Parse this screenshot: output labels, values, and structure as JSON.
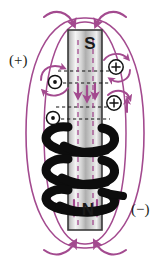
{
  "figure": {
    "type": "physics-diagram",
    "width": 165,
    "height": 266,
    "background_color": "#ffffff"
  },
  "labels": {
    "positive_terminal": "(+)",
    "negative_terminal": "(−)",
    "south_pole": "S",
    "north_pole": "N"
  },
  "colors": {
    "field_line": "#a34a8f",
    "field_line_dark": "#8e3d7c",
    "coil": "#0d0d0d",
    "magnet_edge": "#3a3a3a",
    "magnet_light": "#f2f2f2",
    "magnet_mid": "#b8b8b8",
    "magnet_dark": "#8c8c8c",
    "dashed_line": "#111111",
    "text": "#231f20",
    "symbol_outline": "#111111"
  },
  "magnet": {
    "label_top": "S",
    "label_bottom": "N",
    "x": 68,
    "y": 30,
    "width": 34,
    "height": 200,
    "internal_field_direction": "downward",
    "internal_arrow_count": 5
  },
  "coil": {
    "turns": 3,
    "lead_side": "right",
    "wire_color": "#0d0d0d",
    "current_terminal_in": "(+)",
    "current_terminal_out": "(−)"
  },
  "current_symbols": {
    "out_of_page": {
      "glyph": "⊙",
      "name": "current-out-of-page",
      "count": 2,
      "positions": [
        {
          "x": 55,
          "y": 82
        },
        {
          "x": 53,
          "y": 118
        }
      ]
    },
    "into_page": {
      "glyph": "⊕",
      "name": "current-into-page",
      "count": 2,
      "positions": [
        {
          "x": 116,
          "y": 67
        },
        {
          "x": 114,
          "y": 103
        }
      ]
    }
  },
  "field_lines": {
    "description": "External magnetic field loops around the solenoid",
    "loop_count": 2,
    "arrow_direction_top": "inward-down toward S pole",
    "arrow_direction_bottom": "inward-up toward N pole"
  },
  "dashed_lines": {
    "count": 4,
    "orientation": "horizontal",
    "style": "dashed",
    "color": "#111111"
  }
}
